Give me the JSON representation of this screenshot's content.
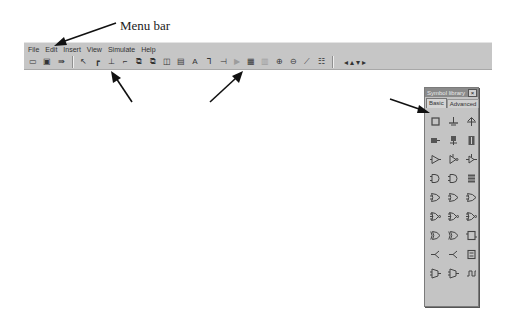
{
  "annotations": {
    "menu_bar": "Menu bar",
    "button_commands": "Button commands",
    "symbol_library": "Symbol library",
    "work_area": "Work area"
  },
  "menubar": {
    "items": [
      "File",
      "Edit",
      "Insert",
      "View",
      "Simulate",
      "Help"
    ]
  },
  "toolbar": {
    "file_buttons": [
      {
        "icon": "open-folder-icon",
        "glyph": "▭"
      },
      {
        "icon": "save-disk-icon",
        "glyph": "▣"
      },
      {
        "icon": "export-icon",
        "glyph": "⇛"
      }
    ],
    "edit_buttons": [
      {
        "icon": "select-arrow-icon",
        "glyph": "↖"
      },
      {
        "icon": "wire-tool-icon",
        "glyph": "┏"
      },
      {
        "icon": "input-pin-icon",
        "glyph": "⊥"
      },
      {
        "icon": "output-pin-icon",
        "glyph": "⌐"
      },
      {
        "icon": "copy-icon",
        "glyph": "⧉"
      },
      {
        "icon": "paste-icon",
        "glyph": "⧉"
      },
      {
        "icon": "flip-icon",
        "glyph": "◫"
      },
      {
        "icon": "delete-icon",
        "glyph": "▤"
      },
      {
        "icon": "text-tool-icon",
        "glyph": "A"
      },
      {
        "icon": "probe-icon",
        "glyph": "⅂"
      },
      {
        "icon": "junction-icon",
        "glyph": "⊣"
      },
      {
        "icon": "run-simulation-icon",
        "glyph": "▶",
        "disabled": true
      },
      {
        "icon": "timing-diagram-icon",
        "glyph": "▦"
      },
      {
        "icon": "truth-table-icon",
        "glyph": "▥",
        "disabled": true
      },
      {
        "icon": "zoom-in-icon",
        "glyph": "⊕"
      },
      {
        "icon": "zoom-out-icon",
        "glyph": "⊖"
      },
      {
        "icon": "waveform-icon",
        "glyph": "⟋"
      },
      {
        "icon": "grid-icon",
        "glyph": "☷"
      }
    ],
    "nav_buttons": [
      {
        "icon": "scroll-left-icon",
        "glyph": "◂"
      },
      {
        "icon": "scroll-up-icon",
        "glyph": "▴"
      },
      {
        "icon": "scroll-down-icon",
        "glyph": "▾"
      },
      {
        "icon": "scroll-right-icon",
        "glyph": "▸"
      }
    ]
  },
  "palette": {
    "title": "Symbol library",
    "close_glyph": "×",
    "tabs": [
      {
        "label": "Basic",
        "active": true
      },
      {
        "label": "Advanced",
        "active": false
      }
    ],
    "symbols": [
      "module-box",
      "ground-symbol",
      "vcc-symbol",
      "switch-input",
      "led-output",
      "display-7seg",
      "buffer-gate",
      "inverter-gate",
      "tristate-buffer",
      "and-gate-2",
      "and-gate-3",
      "register-block",
      "or-gate-2",
      "or-gate-3",
      "or-gate-4",
      "nand-gate-2",
      "nand-gate-3",
      "nand-gate-4",
      "xor-gate-2",
      "xnor-gate-2",
      "flipflop-block",
      "splitter-left",
      "splitter-right",
      "counter-block",
      "mux-block",
      "demux-block",
      "clock-source"
    ]
  },
  "colors": {
    "chrome": "#c6c6c6",
    "palette_title": "#8a8a8a",
    "text": "#333333"
  }
}
